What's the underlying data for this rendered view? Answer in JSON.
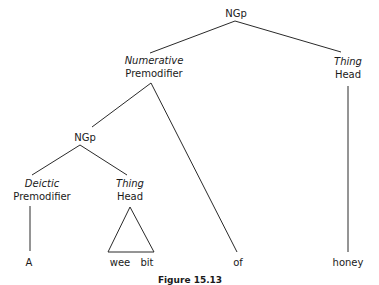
{
  "diagram": {
    "type": "syntax-tree",
    "root": {
      "label": "NGp",
      "children": [
        {
          "function": "Numerative",
          "role": "Premodifier",
          "children": [
            {
              "label": "NGp",
              "children": [
                {
                  "function": "Deictic",
                  "role": "Premodifier",
                  "leaf": "A"
                },
                {
                  "function": "Thing",
                  "role": "Head",
                  "leaf_triangle": [
                    "wee",
                    "bit"
                  ]
                }
              ]
            },
            {
              "leaf": "of"
            }
          ]
        },
        {
          "function": "Thing",
          "role": "Head",
          "leaf": "honey"
        }
      ]
    }
  },
  "nodes": {
    "root_label": "NGp",
    "numerative_function": "Numerative",
    "numerative_role": "Premodifier",
    "thing_right_function": "Thing",
    "thing_right_role": "Head",
    "inner_ngp_label": "NGp",
    "deictic_function": "Deictic",
    "deictic_role": "Premodifier",
    "thing_inner_function": "Thing",
    "thing_inner_role": "Head"
  },
  "leaves": {
    "a": "A",
    "wee": "wee",
    "bit": "bit",
    "of": "of",
    "honey": "honey"
  },
  "caption": "Figure 15.13"
}
